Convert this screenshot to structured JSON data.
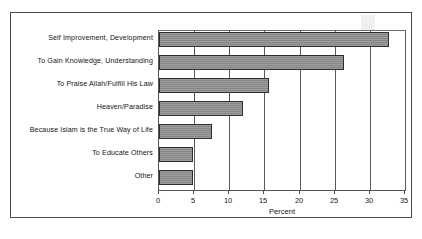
{
  "chart_data": {
    "type": "bar",
    "orientation": "horizontal",
    "title": "",
    "xlabel": "Percent",
    "ylabel": "",
    "xlim": [
      0,
      35
    ],
    "xticks": [
      "0",
      "5",
      "10",
      "15",
      "20",
      "25",
      "30",
      "35"
    ],
    "grid": true,
    "legend": false,
    "bar_color": "#8d8d8d",
    "bar_edge_color": "#2e2e2e",
    "categories": [
      "Self Improvement, Development",
      "To Gain Knowledge, Understanding",
      "To Praise Allah/Fulfill His Law",
      "Heaven/Paradise",
      "Because Islam is the True Way of Life",
      "To Educate Others",
      "Other"
    ],
    "values": [
      32.7,
      26.3,
      15.7,
      11.9,
      7.6,
      4.9,
      4.9
    ]
  }
}
